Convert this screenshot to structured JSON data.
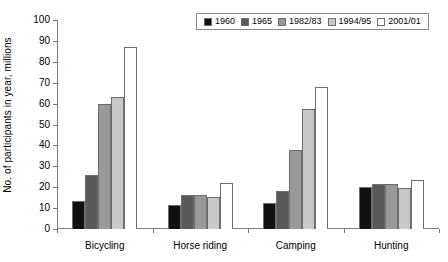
{
  "chart_data": {
    "type": "bar",
    "title": "",
    "xlabel": "",
    "ylabel": "No. of participants in year, millions",
    "ylim": [
      0,
      100
    ],
    "ytick_step": 10,
    "yticks": [
      100,
      90,
      80,
      70,
      60,
      50,
      40,
      30,
      20,
      10,
      0
    ],
    "grid": false,
    "legend_position": "top-right",
    "categories": [
      "Bicycling",
      "Horse riding",
      "Camping",
      "Hunting"
    ],
    "series": [
      {
        "name": "1960",
        "color": "#111111",
        "values": [
          13.5,
          11.5,
          12.5,
          20.0
        ]
      },
      {
        "name": "1965",
        "color": "#595959",
        "values": [
          26.0,
          16.5,
          18.0,
          21.5
        ]
      },
      {
        "name": "1982/83",
        "color": "#999999",
        "values": [
          60.0,
          16.5,
          38.0,
          21.5
        ]
      },
      {
        "name": "1994/95",
        "color": "#c8c8c8",
        "values": [
          63.0,
          15.5,
          57.5,
          19.5
        ]
      },
      {
        "name": "2001/01",
        "color": "#ffffff",
        "values": [
          87.0,
          22.0,
          68.0,
          23.5
        ]
      }
    ]
  }
}
